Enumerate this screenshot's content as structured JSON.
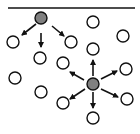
{
  "diagram": {
    "width": 140,
    "height": 134,
    "colors": {
      "background": "#ffffff",
      "stroke": "#111111",
      "active_fill": "#808080",
      "inactive_fill": "#ffffff"
    },
    "top_line": {
      "x1": 8,
      "y1": 8,
      "x2": 135,
      "y2": 8
    },
    "node_radius": 6,
    "active_nodes": [
      {
        "id": "a1",
        "x": 41,
        "y": 18
      },
      {
        "id": "a2",
        "x": 93,
        "y": 84
      }
    ],
    "inactive_nodes": [
      {
        "id": "n1",
        "x": 13,
        "y": 42
      },
      {
        "id": "n2",
        "x": 40,
        "y": 58
      },
      {
        "id": "n3",
        "x": 71,
        "y": 42
      },
      {
        "id": "n4",
        "x": 93,
        "y": 22
      },
      {
        "id": "n5",
        "x": 123,
        "y": 36
      },
      {
        "id": "n6",
        "x": 93,
        "y": 49
      },
      {
        "id": "n7",
        "x": 63,
        "y": 63
      },
      {
        "id": "n8",
        "x": 126,
        "y": 69
      },
      {
        "id": "n9",
        "x": 15,
        "y": 78
      },
      {
        "id": "n10",
        "x": 41,
        "y": 92
      },
      {
        "id": "n11",
        "x": 63,
        "y": 103
      },
      {
        "id": "n12",
        "x": 127,
        "y": 99
      },
      {
        "id": "n13",
        "x": 93,
        "y": 118
      }
    ],
    "arrows": [
      {
        "from": "a1",
        "x1": 36,
        "y1": 24,
        "x2": 22,
        "y2": 35
      },
      {
        "from": "a1",
        "x1": 41,
        "y1": 33,
        "x2": 41,
        "y2": 47
      },
      {
        "from": "a1",
        "x1": 52,
        "y1": 26,
        "x2": 64,
        "y2": 36
      },
      {
        "from": "a2",
        "x1": 93,
        "y1": 76,
        "x2": 93,
        "y2": 60
      },
      {
        "from": "a2",
        "x1": 101,
        "y1": 79,
        "x2": 117,
        "y2": 71
      },
      {
        "from": "a2",
        "x1": 101,
        "y1": 89,
        "x2": 118,
        "y2": 97
      },
      {
        "from": "a2",
        "x1": 93,
        "y1": 92,
        "x2": 93,
        "y2": 108
      },
      {
        "from": "a2",
        "x1": 85,
        "y1": 89,
        "x2": 70,
        "y2": 99
      },
      {
        "from": "a2",
        "x1": 84,
        "y1": 80,
        "x2": 70,
        "y2": 72
      }
    ]
  }
}
